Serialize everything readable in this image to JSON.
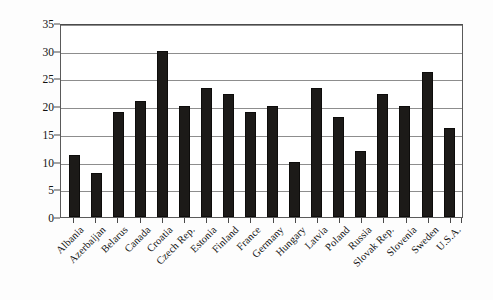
{
  "chart_data": {
    "type": "bar",
    "title": "",
    "subtitle": "",
    "xlabel": "",
    "ylabel": "G/GDP (percent)",
    "ylim": [
      0,
      35
    ],
    "y_ticks": [
      0,
      5,
      10,
      15,
      20,
      25,
      30,
      35
    ],
    "grid": true,
    "legend": false,
    "legend_position": "none",
    "bar_color": "#1c1a18",
    "categories": [
      "Albania",
      "Azerbaijan",
      "Belarus",
      "Canada",
      "Croatia",
      "Czech Rep.",
      "Estonia",
      "Finland",
      "France",
      "Germany",
      "Hungary",
      "Latvia",
      "Poland",
      "Russia",
      "Slovak Rep.",
      "Slovenia",
      "Sweden",
      "U.S.A."
    ],
    "values": [
      11.2,
      8.0,
      19.0,
      21.0,
      30.0,
      20.1,
      23.3,
      22.2,
      19.0,
      20.0,
      10.0,
      23.3,
      18.0,
      12.0,
      22.2,
      20.0,
      26.1,
      16.0
    ]
  },
  "axis": {
    "y_tick_labels": [
      "0",
      "5",
      "10",
      "15",
      "20",
      "25",
      "30",
      "35"
    ],
    "y_title": "G/GDP (percent)"
  }
}
